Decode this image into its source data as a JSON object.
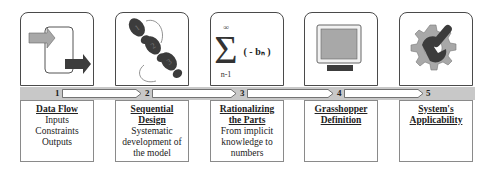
{
  "steps": [
    {
      "number": "1",
      "title_lines": [
        "Data Flow"
      ],
      "body_lines": [
        "Inputs",
        "Constraints",
        "Outputs"
      ],
      "icon": "data-flow-arrows-icon"
    },
    {
      "number": "2",
      "title_lines": [
        "Sequential",
        "Design"
      ],
      "body_lines": [
        "Systematic",
        "development of",
        "the model"
      ],
      "icon": "footsteps-icon"
    },
    {
      "number": "3",
      "title_lines": [
        "Rationalizing",
        "the Parts"
      ],
      "body_lines": [
        "From implicit",
        "knowledge to",
        "numbers"
      ],
      "icon": "summation-icon"
    },
    {
      "number": "4",
      "title_lines": [
        "Grasshopper",
        "Definition"
      ],
      "body_lines": [],
      "icon": "monitor-icon"
    },
    {
      "number": "5",
      "title_lines": [
        "System's",
        "Applicability"
      ],
      "body_lines": [],
      "icon": "gear-wrench-icon"
    }
  ],
  "summation": {
    "upper": "∞",
    "lower": "n-1",
    "term": "( - bₙ )"
  },
  "footsteps": [
    "1",
    "2",
    "3"
  ],
  "colors": {
    "bar": "#c8c8c8",
    "icon_dark": "#3c3c3c",
    "icon_light": "#a8a8a8",
    "border": "#4a4a4a"
  }
}
